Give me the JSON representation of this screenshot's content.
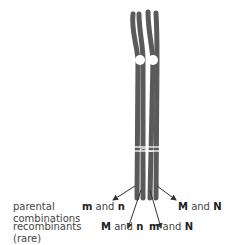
{
  "diagram": {
    "row_labels": {
      "parental": [
        "parental",
        "combinations"
      ],
      "recombinants": [
        "recombinants",
        "(rare)"
      ]
    },
    "parental_outcomes": [
      {
        "a": "m",
        "join": "and",
        "b": "n"
      },
      {
        "a": "M",
        "join": "and",
        "b": "N"
      }
    ],
    "recombinant_outcomes": [
      {
        "a": "M",
        "join": "and",
        "b": "n"
      },
      {
        "a": "m",
        "join": "and",
        "b": "N"
      }
    ],
    "colors": {
      "chromatid": "#5a5a5a",
      "arrow": "#333333",
      "centromere": "#ffffff"
    }
  }
}
